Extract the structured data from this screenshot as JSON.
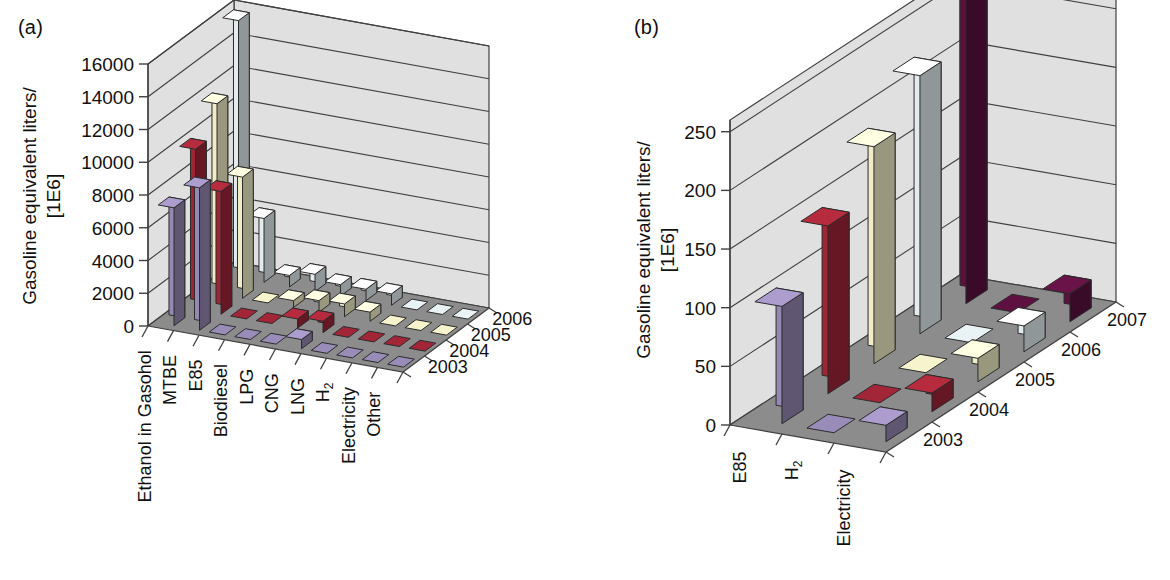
{
  "figure": {
    "background": "#ffffff",
    "panels": [
      {
        "tag": "(a)",
        "tag_x": 18,
        "tag_y": 18
      },
      {
        "tag": "(b)",
        "tag_x": 632,
        "tag_y": 18
      }
    ],
    "series_colors": {
      "2003": "#9a8cb8",
      "2004": "#a32638",
      "2005": "#f7f3cc",
      "2006": "#e9f3f5",
      "2007": "#5e1140"
    },
    "wall_fill": "#e0e0e0",
    "floor_fill": "#8c8c8c",
    "line_color": "#404040"
  },
  "chart_data": [
    {
      "id": "panel-a",
      "type": "bar",
      "dimension": "3d",
      "title": "",
      "panel_label": "(a)",
      "ylabel": "Gasoline equivalent liters/",
      "ylabel_line2": "[1E6]",
      "ylim": [
        0,
        16000
      ],
      "yticks": [
        0,
        2000,
        4000,
        6000,
        8000,
        10000,
        12000,
        14000,
        16000
      ],
      "ytick_labels": [
        "0",
        "2000",
        "4000",
        "6000",
        "8000",
        "10000",
        "12000",
        "14000",
        "16000"
      ],
      "grid": true,
      "legend_position": "none",
      "categories": [
        "Ethanol in Gasohol",
        "MTBE",
        "E85",
        "Biodiesel",
        "LPG",
        "CNG",
        "LNG",
        "H2",
        "Electricity",
        "Other"
      ],
      "category_labels": [
        "Ethanol in Gasohol",
        "MTBE",
        "E85",
        "Biodiesel",
        "LPG",
        "CNG",
        "LNG",
        "H₂",
        "Electricity",
        "Other"
      ],
      "depth_axis": "year",
      "depth_categories": [
        "2003",
        "2004",
        "2005",
        "2006"
      ],
      "series": [
        {
          "name": "2003",
          "color": "#9a8cb8",
          "values": [
            7200,
            8700,
            0,
            0,
            0,
            560,
            0,
            0,
            0,
            0
          ]
        },
        {
          "name": "2004",
          "color": "#a32638",
          "values": [
            9800,
            7500,
            0,
            0,
            560,
            700,
            0,
            0,
            0,
            0
          ]
        },
        {
          "name": "2005",
          "color": "#f7f3cc",
          "values": [
            11600,
            7400,
            0,
            420,
            700,
            780,
            560,
            0,
            0,
            0
          ]
        },
        {
          "name": "2006",
          "color": "#e9f3f5",
          "values": [
            15700,
            3900,
            700,
            1050,
            700,
            700,
            700,
            0,
            0,
            0
          ]
        }
      ]
    },
    {
      "id": "panel-b",
      "type": "bar",
      "dimension": "3d",
      "title": "",
      "panel_label": "(b)",
      "ylabel": "Gasoline equivalent liters/",
      "ylabel_line2": "[1E6]",
      "ylim": [
        0,
        260
      ],
      "yticks": [
        0,
        50,
        100,
        150,
        200,
        250
      ],
      "ytick_labels": [
        "0",
        "50",
        "100",
        "150",
        "200",
        "250"
      ],
      "grid": true,
      "legend_position": "none",
      "categories": [
        "E85",
        "H2",
        "Electricity"
      ],
      "category_labels": [
        "E85",
        "H₂",
        "Electricity"
      ],
      "depth_axis": "year",
      "depth_categories": [
        "2003",
        "2004",
        "2005",
        "2006",
        "2007"
      ],
      "series": [
        {
          "name": "2003",
          "color": "#9a8cb8",
          "values": [
            100,
            0,
            14
          ]
        },
        {
          "name": "2004",
          "color": "#a32638",
          "values": [
            143,
            0,
            16
          ]
        },
        {
          "name": "2005",
          "color": "#f7f3cc",
          "values": [
            185,
            0,
            20
          ]
        },
        {
          "name": "2006",
          "color": "#e9f3f5",
          "values": [
            220,
            0,
            22
          ]
        },
        {
          "name": "2007",
          "color": "#5e1140",
          "values": [
            265,
            0,
            24
          ]
        }
      ]
    }
  ]
}
